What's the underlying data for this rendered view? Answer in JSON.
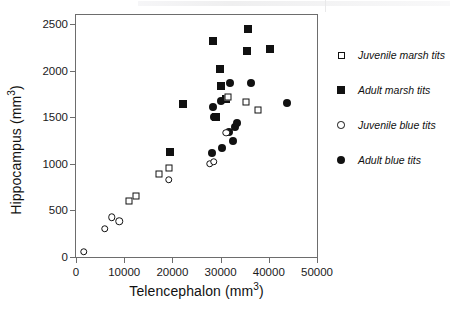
{
  "chart_data": {
    "type": "scatter",
    "title": "",
    "xlabel": "Telencephalon (mm3)",
    "ylabel": "Hippocampus (mm3)",
    "xlabel_base": "Telencephalon (mm",
    "xlabel_sup": "3",
    "xlabel_tail": ")",
    "ylabel_base": "Hippocampus (mm",
    "ylabel_sup": "3",
    "ylabel_tail": ")",
    "xlim": [
      0,
      50000
    ],
    "ylim": [
      0,
      2600
    ],
    "x_ticks": [
      0,
      10000,
      20000,
      30000,
      40000,
      50000
    ],
    "x_tick_labels": [
      "0",
      "10000",
      "20000",
      "30000",
      "40000",
      "50000"
    ],
    "y_ticks": [
      0,
      500,
      1000,
      1500,
      2000,
      2500
    ],
    "y_tick_labels": [
      "0",
      "500",
      "1000",
      "1500",
      "2000",
      "2500"
    ],
    "grid": false,
    "legend_position": "right",
    "marker_color": "#111111",
    "axis_color": "#6d6d6d",
    "series": [
      {
        "name": "Juvenile marsh tits",
        "marker": "square-open",
        "points": [
          [
            10900,
            600
          ],
          [
            12400,
            660
          ],
          [
            17200,
            890
          ],
          [
            19300,
            960
          ],
          [
            31500,
            1715
          ],
          [
            35300,
            1670
          ],
          [
            37800,
            1580
          ]
        ]
      },
      {
        "name": "Adult marsh tits",
        "marker": "square-filled",
        "points": [
          [
            19500,
            1125
          ],
          [
            22300,
            1645
          ],
          [
            28400,
            2325
          ],
          [
            29900,
            2015
          ],
          [
            29000,
            1500
          ],
          [
            30100,
            1835
          ],
          [
            31100,
            1700
          ],
          [
            35700,
            2445
          ],
          [
            35400,
            2215
          ],
          [
            40300,
            2230
          ]
        ]
      },
      {
        "name": "Juvenile blue tits",
        "marker": "circle-open",
        "points": [
          [
            1600,
            55
          ],
          [
            6000,
            305
          ],
          [
            7400,
            425
          ],
          [
            9000,
            385
          ],
          [
            19200,
            830
          ],
          [
            27700,
            1000
          ],
          [
            28600,
            1025
          ],
          [
            31200,
            1335
          ]
        ]
      },
      {
        "name": "Adult blue tits",
        "marker": "circle-filled",
        "points": [
          [
            28400,
            1610
          ],
          [
            28600,
            1505
          ],
          [
            28300,
            1115
          ],
          [
            30100,
            1680
          ],
          [
            30300,
            1170
          ],
          [
            31700,
            1340
          ],
          [
            32500,
            1245
          ],
          [
            33000,
            1395
          ],
          [
            33500,
            1435
          ],
          [
            32000,
            1870
          ],
          [
            36300,
            1870
          ],
          [
            43800,
            1650
          ]
        ]
      }
    ]
  },
  "legend": {
    "items": [
      {
        "label": "Juvenile marsh tits",
        "marker": "square-open"
      },
      {
        "label": "Adult marsh tits",
        "marker": "square-filled"
      },
      {
        "label": "Juvenile blue tits",
        "marker": "circle-open"
      },
      {
        "label": "Adult blue tits",
        "marker": "circle-filled"
      }
    ]
  }
}
